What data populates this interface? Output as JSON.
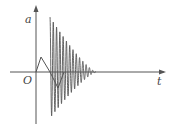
{
  "diagram": {
    "type": "acceleration-time graph",
    "axes": {
      "y_label": "a",
      "x_label": "t",
      "origin_label": "O"
    },
    "colors": {
      "stroke": "#555555",
      "background": "#ffffff"
    },
    "curve": {
      "description": "small triangular pulse followed by a large damped oscillation decaying to zero",
      "pulse": [
        [
          36,
          72
        ],
        [
          41,
          57
        ],
        [
          58,
          88
        ]
      ],
      "oscillation_start_x": 50,
      "oscillation_end_x": 96,
      "initial_peak_y": 17,
      "initial_trough_y": 118,
      "cycles": 14
    }
  }
}
